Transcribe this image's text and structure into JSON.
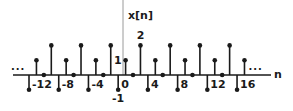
{
  "chart_data": {
    "type": "stem",
    "title": "",
    "ylabel": "x[n]",
    "xlabel": "n",
    "periodic": true,
    "period": 4,
    "one_period": {
      "n": [
        0,
        1,
        2,
        3
      ],
      "values": [
        1,
        0,
        2,
        -1
      ]
    },
    "n": [
      -13,
      -12,
      -11,
      -10,
      -9,
      -8,
      -7,
      -6,
      -5,
      -4,
      -3,
      -2,
      -1,
      0,
      1,
      2,
      3,
      4,
      5,
      6,
      7,
      8,
      9,
      10,
      11,
      12,
      13,
      14,
      15,
      16
    ],
    "values": [
      -1,
      1,
      0,
      2,
      -1,
      1,
      0,
      2,
      -1,
      1,
      0,
      2,
      -1,
      1,
      0,
      2,
      -1,
      1,
      0,
      2,
      -1,
      1,
      0,
      2,
      -1,
      1,
      0,
      2,
      -1,
      1
    ],
    "x_tick_labels": [
      {
        "text": "-12",
        "anchor_n": -13
      },
      {
        "text": "-8",
        "anchor_n": -9
      },
      {
        "text": "-4",
        "anchor_n": -5
      },
      {
        "text": "0",
        "anchor_n": -1
      },
      {
        "text": "4",
        "anchor_n": 3
      },
      {
        "text": "8",
        "anchor_n": 7
      },
      {
        "text": "12",
        "anchor_n": 11
      },
      {
        "text": "16",
        "anchor_n": 15
      }
    ],
    "value_labels": [
      {
        "text": "1",
        "n": 0,
        "value": 1
      },
      {
        "text": "2",
        "n": 2,
        "value": 2
      },
      {
        "text": "-1",
        "n": -1,
        "value": -1
      }
    ],
    "continuation": "...",
    "grid": false,
    "ylim": [
      -1,
      2
    ]
  },
  "layout": {
    "origin_x": 125.6,
    "axis_y": 75,
    "px_per_n": 7.43,
    "px_per_unit": 14.8,
    "yaxis_x": 123,
    "axis_x_start": 13,
    "axis_x_end": 271,
    "ink": "#1a1a1a",
    "yaxis_color": "#9a9a9a"
  }
}
